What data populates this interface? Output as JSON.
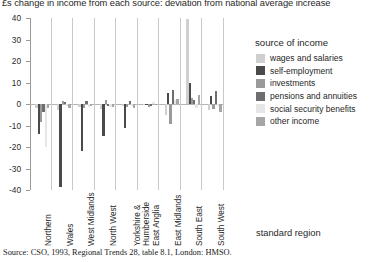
{
  "chart_data": {
    "type": "bar",
    "title": "£s change in income from each source: deviation from national average increase",
    "xlabel": "standard region",
    "ylabel": "",
    "ylim": [
      -40,
      40
    ],
    "yticks": [
      40,
      30,
      20,
      10,
      0,
      -10,
      -20,
      -30,
      -40
    ],
    "ytick_labels": [
      "40",
      "30",
      "20",
      "10",
      "0",
      "-10",
      "-20",
      "-30",
      "-40"
    ],
    "grid": false,
    "legend_title": "source of income",
    "legend_position": "right",
    "categories": [
      "Northern",
      "Wales",
      "West Midlands",
      "North West",
      "Yorkshire & Humberside",
      "East Anglia",
      "East Midlands",
      "South East",
      "South West"
    ],
    "category_lines": [
      [
        "Northern"
      ],
      [
        "Wales"
      ],
      [
        "West Midlands"
      ],
      [
        "North West"
      ],
      [
        "Yorkshire &",
        "Humberside"
      ],
      [
        "East Anglia"
      ],
      [
        "East Midlands"
      ],
      [
        "South East"
      ],
      [
        "South West"
      ]
    ],
    "series": [
      {
        "name": "wages and salaries",
        "color": "#cfcfcf",
        "values": [
          -2.0,
          -3.0,
          -1.5,
          -2.5,
          -1.0,
          -0.5,
          -5.0,
          39.5,
          -3.0
        ]
      },
      {
        "name": "self-employment",
        "color": "#4a4a4a",
        "values": [
          -14.0,
          -38.5,
          -22.0,
          -15.0,
          -11.0,
          -0.5,
          5.0,
          10.0,
          3.5
        ]
      },
      {
        "name": "investments",
        "color": "#9a9a9a",
        "values": [
          -8.5,
          1.5,
          -2.0,
          2.0,
          -1.5,
          -1.5,
          -9.5,
          3.0,
          -2.5
        ]
      },
      {
        "name": "pensions and annuities",
        "color": "#6e6e6e",
        "values": [
          -3.5,
          1.0,
          1.5,
          -1.0,
          1.5,
          -1.0,
          6.5,
          2.0,
          6.0
        ]
      },
      {
        "name": "social security benefits",
        "color": "#e6e6e6",
        "values": [
          -20.0,
          -1.0,
          -1.5,
          -1.5,
          -1.0,
          1.0,
          2.0,
          -2.0,
          -1.0
        ]
      },
      {
        "name": "other income",
        "color": "#a6a6a6",
        "values": [
          -2.0,
          -2.0,
          -1.0,
          -1.5,
          -2.0,
          -0.5,
          2.5,
          4.0,
          -3.5
        ]
      }
    ]
  },
  "source_note": "Source: CSO, 1993, Regional Trends 28, table 8.1, London: HMSO."
}
